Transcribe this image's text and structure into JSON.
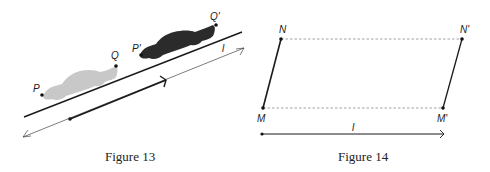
{
  "figure13": {
    "caption": "Figure 13",
    "labels": {
      "P": "P",
      "Q": "Q",
      "P_prime": "P'",
      "Q_prime": "Q'",
      "l": "l"
    },
    "colors": {
      "car_original": "#c8c8c8",
      "car_translated": "#2b2b2b",
      "line": "#1a1a1a"
    }
  },
  "figure14": {
    "caption": "Figure 14",
    "labels": {
      "N": "N",
      "M": "M",
      "N_prime": "N'",
      "M_prime": "M'",
      "l": "l"
    },
    "colors": {
      "segment": "#1a1a1a",
      "dashed": "#888888"
    }
  }
}
